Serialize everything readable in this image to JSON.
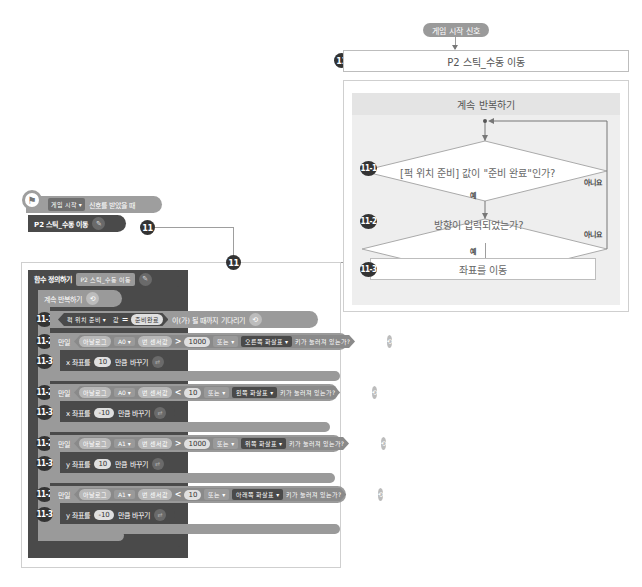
{
  "flowchart": {
    "signal": "게임 시작 신호",
    "function_badge": "11",
    "function_title": "P2 스틱_수동 이동",
    "loop_title": "계속 반복하기",
    "steps": [
      {
        "id": "11-1",
        "text": "[퍽 위치 준비] 값이 \"준비 완료\"인가?",
        "yes": "예",
        "no": "아니요"
      },
      {
        "id": "11-2",
        "text": "방향이 입력되었는가?",
        "yes": "예",
        "no": "아니요"
      },
      {
        "id": "11-3",
        "text": "좌표를 이동"
      }
    ]
  },
  "connector_badges": [
    "11",
    "11"
  ],
  "event": {
    "dropdown": "게임 시작 ▾",
    "text": "신호를 받았을 때",
    "call_label": "P2 스틱_수동 이동"
  },
  "definition": {
    "head": "함수 정의하기",
    "name": "P2 스틱_수동 이동",
    "loop": "계속 반복하기",
    "wait": {
      "badge": "11-1",
      "var": "퍽 위치 준비 ▾",
      "value_word": "값",
      "op": "=",
      "value": "준비완료",
      "suffix": "이(가) 될 때까지 기다리기"
    },
    "ifs": [
      {
        "badge": "11-2",
        "kw": "만일",
        "sensor": "아날로그",
        "pin": "A0 ▾",
        "sensor_val": "번 센서값",
        "op": ">",
        "num": "1000",
        "or": "또는 ▾",
        "key": "오른쪽 화살표 ▾",
        "key_q": "키가 눌러져 있는가?",
        "then": "(이)라면",
        "action": {
          "badge": "11-3",
          "axis": "x 좌표를",
          "delta": "10",
          "suffix": "만큼 바꾸기"
        }
      },
      {
        "badge": "11-2",
        "kw": "만일",
        "sensor": "아날로그",
        "pin": "A0 ▾",
        "sensor_val": "번 센서값",
        "op": "<",
        "num": "10",
        "or": "또는 ▾",
        "key": "왼쪽 화살표 ▾",
        "key_q": "키가 눌러져 있는가?",
        "then": "(이)라면",
        "action": {
          "badge": "11-3",
          "axis": "x 좌표를",
          "delta": "-10",
          "suffix": "만큼 바꾸기"
        }
      },
      {
        "badge": "11-2",
        "kw": "만일",
        "sensor": "아날로그",
        "pin": "A1 ▾",
        "sensor_val": "번 센서값",
        "op": ">",
        "num": "1000",
        "or": "또는 ▾",
        "key": "위쪽 화살표 ▾",
        "key_q": "키가 눌러져 있는가?",
        "then": "(이)라면",
        "action": {
          "badge": "11-3",
          "axis": "y 좌표를",
          "delta": "10",
          "suffix": "만큼 바꾸기"
        }
      },
      {
        "badge": "11-2",
        "kw": "만일",
        "sensor": "아날로그",
        "pin": "A1 ▾",
        "sensor_val": "번 센서값",
        "op": "<",
        "num": "10",
        "or": "또는 ▾",
        "key": "아래쪽 화살표 ▾",
        "key_q": "키가 눌러져 있는가?",
        "then": "(이)라면",
        "action": {
          "badge": "11-3",
          "axis": "y 좌표를",
          "delta": "-10",
          "suffix": "만큼 바꾸기"
        }
      }
    ]
  }
}
